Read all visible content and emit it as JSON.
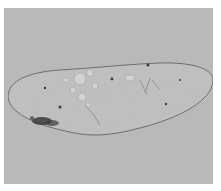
{
  "image": {
    "subject": "ciliate protozoan (Paramecium-like cell) under light microscopy",
    "colors": {
      "border": "#ffffff",
      "background": "#b9b9b9",
      "cell_body": "#c4c4c4",
      "cell_outline": "#6e6e6e",
      "granules": "#3a3a3a",
      "vacuoles": "#d4d4d4"
    }
  }
}
